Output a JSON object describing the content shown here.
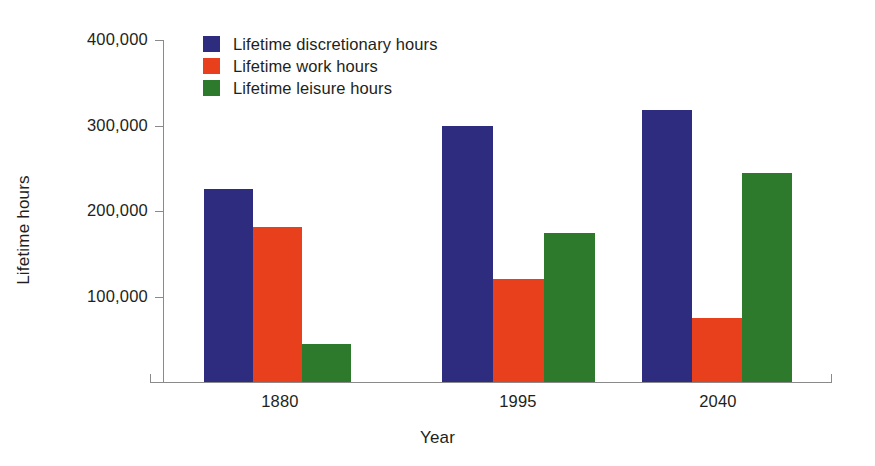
{
  "chart_data": {
    "type": "bar",
    "title": "",
    "xlabel": "Year",
    "ylabel": "Lifetime hours",
    "categories": [
      "1880",
      "1995",
      "2040"
    ],
    "series": [
      {
        "name": "Lifetime discretionary hours",
        "color": "#2e2c7f",
        "values": [
          226000,
          299000,
          318000
        ]
      },
      {
        "name": "Lifetime work hours",
        "color": "#e8401c",
        "values": [
          181000,
          121000,
          75000
        ]
      },
      {
        "name": "Lifetime leisure hours",
        "color": "#2d7a2d",
        "values": [
          45000,
          174000,
          245000
        ]
      }
    ],
    "ylim": [
      0,
      400000
    ],
    "ytick_values": [
      100000,
      200000,
      300000,
      400000
    ],
    "ytick_labels": [
      "100,000",
      "200,000",
      "300,000",
      "400,000"
    ],
    "grid": false,
    "legend_position": "top-left-inside"
  },
  "axes": {
    "y_title": "Lifetime hours",
    "x_title": "Year"
  },
  "legend": {
    "entries": [
      {
        "label": "Lifetime discretionary hours",
        "color": "#2e2c7f"
      },
      {
        "label": "Lifetime work hours",
        "color": "#e8401c"
      },
      {
        "label": "Lifetime leisure hours",
        "color": "#2d7a2d"
      }
    ]
  },
  "ticks": {
    "y": [
      {
        "label": "400,000",
        "value": 400000
      },
      {
        "label": "300,000",
        "value": 300000
      },
      {
        "label": "200,000",
        "value": 200000
      },
      {
        "label": "100,000",
        "value": 100000
      }
    ],
    "x": [
      {
        "label": "1880"
      },
      {
        "label": "1995"
      },
      {
        "label": "2040"
      }
    ]
  },
  "colors": {
    "discretionary": "#2e2c7f",
    "work": "#e8401c",
    "leisure": "#2d7a2d",
    "axis": "#8a8a8a",
    "text": "#231f20",
    "background": "#ffffff"
  }
}
